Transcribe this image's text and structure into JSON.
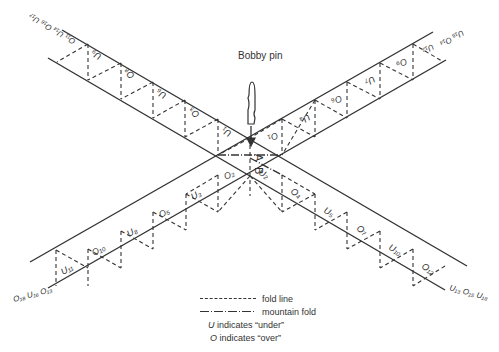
{
  "diagram": {
    "pin_label": "Bobby pin",
    "center_labels": [
      "A",
      "B"
    ],
    "strip_nw": {
      "end_labels": "O₁₁ U₁₄ O₁₆ U₁₇",
      "cells": [
        "U₉",
        "O₈",
        "U₆",
        "O₃",
        "U₁"
      ]
    },
    "strip_ne": {
      "end_labels": "U₁₂ U₁₅ O₁₄ U₁₇",
      "end_labels_near": "U₁₂",
      "end_labels_far": "U₁₅ O₁₄",
      "cells": [
        "O₁",
        "U₄",
        "O₆",
        "U₇",
        "O₉"
      ]
    },
    "strip_sw": {
      "end_labels": "O₁₈ U₁₆ O₁₃",
      "cells": [
        "O₂",
        "U₃",
        "O₅",
        "U₈",
        "O₁₀",
        "U₁₁"
      ]
    },
    "strip_se": {
      "end_labels": "U₁₃ O₁₅ U₁₈",
      "cells": [
        "U₂",
        "O₄",
        "U₅",
        "O₇",
        "U₁₀",
        "O₁₂"
      ]
    }
  },
  "legend": {
    "fold_line": "fold line",
    "mountain_fold": "mountain fold",
    "u_note_letter": "U",
    "u_note": " indicates “under”",
    "o_note_letter": "O",
    "o_note": " indicates “over”"
  }
}
